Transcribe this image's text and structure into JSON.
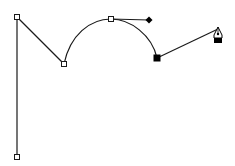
{
  "canvas": {
    "width": 235,
    "height": 166,
    "background": "#ffffff"
  },
  "colors": {
    "stroke": "#1a1a1a",
    "anchor_fill": "#ffffff",
    "selected_fill": "#000000"
  },
  "path": {
    "segments": [
      {
        "type": "line",
        "from": [
          17,
          157
        ],
        "to": [
          17,
          17
        ]
      },
      {
        "type": "line",
        "from": [
          17,
          17
        ],
        "to": [
          64,
          64
        ]
      },
      {
        "type": "curve",
        "from": [
          64,
          64
        ],
        "c1": [
          70,
          35
        ],
        "c2": [
          90,
          19
        ],
        "to": [
          111,
          19
        ]
      },
      {
        "type": "curve",
        "from": [
          111,
          19
        ],
        "c1": [
          130,
          19
        ],
        "c2": [
          152,
          35
        ],
        "to": [
          157,
          58
        ]
      },
      {
        "type": "line",
        "from": [
          157,
          58
        ],
        "to": [
          218,
          29
        ]
      }
    ]
  },
  "anchors": [
    {
      "name": "anchor-bottom",
      "x": 17,
      "y": 157,
      "selected": false
    },
    {
      "name": "anchor-top-left",
      "x": 17,
      "y": 17,
      "selected": false
    },
    {
      "name": "anchor-valley",
      "x": 64,
      "y": 64,
      "selected": false
    },
    {
      "name": "anchor-arc-top",
      "x": 111,
      "y": 19,
      "selected": false
    },
    {
      "name": "anchor-selected",
      "x": 157,
      "y": 58,
      "selected": true
    }
  ],
  "handle": {
    "from": [
      111,
      19
    ],
    "to": [
      149,
      20
    ]
  },
  "cursor": {
    "tool": "pen-tool",
    "tip": [
      218,
      28
    ]
  }
}
